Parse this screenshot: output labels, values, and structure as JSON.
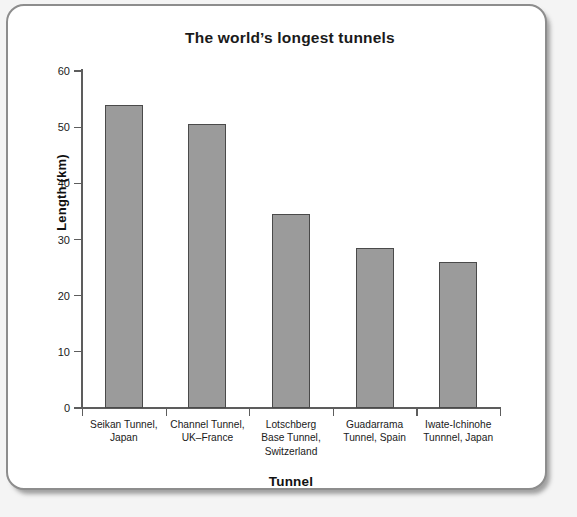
{
  "chart_data": {
    "type": "bar",
    "title": "The world’s longest tunnels",
    "xlabel": "Tunnel",
    "ylabel": "Length (km)",
    "categories": [
      "Seikan Tunnel, Japan",
      "Channel Tunnel, UK–France",
      "Lotschberg Base Tunnel, Switzerland",
      "Guadarrama Tunnel, Spain",
      "Iwate-Ichinohe Tunnnel, Japan"
    ],
    "category_lines": [
      [
        "Seikan Tunnel,",
        "Japan"
      ],
      [
        "Channel Tunnel,",
        "UK–France"
      ],
      [
        "Lotschberg",
        "Base Tunnel,",
        "Switzerland"
      ],
      [
        "Guadarrama",
        "Tunnel, Spain"
      ],
      [
        "Iwate-Ichinohe",
        "Tunnnel, Japan"
      ]
    ],
    "values": [
      53.9,
      50.5,
      34.6,
      28.4,
      26.0
    ],
    "ylim": [
      0,
      60
    ],
    "yticks": [
      0,
      10,
      20,
      30,
      40,
      50,
      60
    ],
    "ytick_labels": [
      "0",
      "10",
      "20",
      "30",
      "40",
      "50",
      "60"
    ],
    "grid": false,
    "legend": false,
    "bar_color": "#9b9b9b",
    "bar_edge_color": "#4a4a4a",
    "axis_color": "#5d5d5d",
    "text_color": "#1a1a1a"
  },
  "frame": {
    "border_color": "#8d8d8d",
    "background": "#ffffff"
  }
}
